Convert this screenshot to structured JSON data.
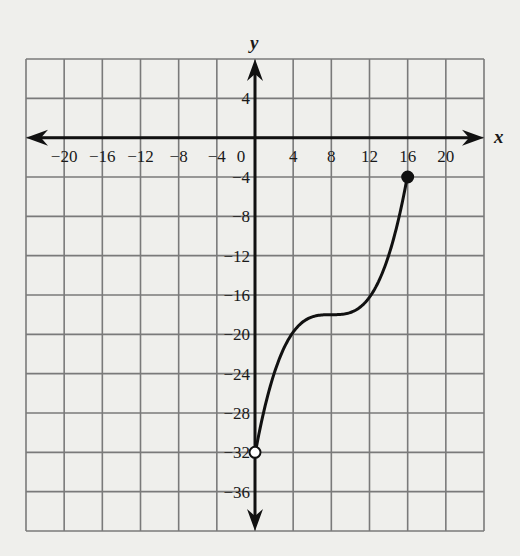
{
  "chart_data": {
    "type": "line",
    "title": "",
    "xlabel": "x",
    "ylabel": "y",
    "xlim": [
      -24,
      24
    ],
    "ylim": [
      -40,
      8
    ],
    "grid": true,
    "grid_step": 4,
    "x_ticks": [
      -20,
      -16,
      -12,
      -8,
      -4,
      0,
      4,
      8,
      12,
      16,
      20
    ],
    "x_tick_labels": [
      "−20",
      "−16",
      "−12",
      "−8",
      "−4",
      "0",
      "4",
      "8",
      "12",
      "16",
      "20"
    ],
    "y_ticks": [
      4,
      -4,
      -8,
      -12,
      -16,
      -20,
      -24,
      -28,
      -32,
      -36
    ],
    "y_tick_labels": [
      "4",
      "−4",
      "−8",
      "−12",
      "−16",
      "−20",
      "−24",
      "−28",
      "−32",
      "−36"
    ],
    "series": [
      {
        "name": "f(x)",
        "x": [
          0,
          2,
          4,
          6,
          8,
          10,
          12,
          14,
          16
        ],
        "y": [
          -32,
          -24,
          -20,
          -18.2,
          -18,
          -17.8,
          -16,
          -12,
          -4
        ]
      }
    ],
    "endpoints": [
      {
        "x": 0,
        "y": -32,
        "style": "open"
      },
      {
        "x": 16,
        "y": -4,
        "style": "closed"
      }
    ],
    "axes_arrows": true
  },
  "colors": {
    "background": "#efefec",
    "grid": "#7a7a7a",
    "axis": "#111111",
    "curve": "#111111"
  }
}
